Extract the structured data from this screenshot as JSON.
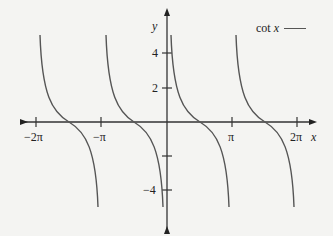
{
  "chart_data": {
    "type": "line",
    "title": "",
    "xlabel": "x",
    "ylabel": "y",
    "function": "cot x",
    "series": [
      {
        "name": "cot x",
        "color": "#555555",
        "branches": [
          {
            "domain": [
              "-2π",
              "-π"
            ],
            "points": [
              [
                -6.08,
                5
              ],
              [
                -5.5,
                1.41
              ],
              [
                -4.712,
                0
              ],
              [
                -3.93,
                -1.0
              ],
              [
                -3.34,
                -5
              ]
            ]
          },
          {
            "domain": [
              "-π",
              "0"
            ],
            "points": [
              [
                -2.94,
                5
              ],
              [
                -2.36,
                1.0
              ],
              [
                -1.571,
                0
              ],
              [
                -0.785,
                -1.0
              ],
              [
                -0.2,
                -5
              ]
            ]
          },
          {
            "domain": [
              "0",
              "π"
            ],
            "points": [
              [
                0.2,
                5
              ],
              [
                0.785,
                1.0
              ],
              [
                1.571,
                0
              ],
              [
                2.36,
                -1.0
              ],
              [
                2.94,
                -5
              ]
            ]
          },
          {
            "domain": [
              "π",
              "2π"
            ],
            "points": [
              [
                3.34,
                5
              ],
              [
                3.93,
                1.0
              ],
              [
                4.712,
                0
              ],
              [
                5.5,
                -1.41
              ],
              [
                6.08,
                -5
              ]
            ]
          }
        ]
      }
    ],
    "x_ticks": [
      "-2π",
      "-π",
      "π",
      "2π"
    ],
    "x_tick_values": [
      -6.2832,
      -3.1416,
      3.1416,
      6.2832
    ],
    "y_ticks": [
      4,
      2,
      -2,
      -4
    ],
    "y_tick_labels": [
      "4",
      "2",
      "",
      "-4"
    ],
    "xlim": [
      -7.0,
      7.5
    ],
    "ylim": [
      -5.5,
      5.5
    ],
    "grid": false,
    "legend": {
      "position": "top-right",
      "entries": [
        "cot x"
      ]
    }
  },
  "labels": {
    "x_axis": "x",
    "y_axis": "y",
    "legend": "cot x",
    "tick_neg_2pi": "−2π",
    "tick_neg_pi": "−π",
    "tick_pi": "π",
    "tick_2pi": "2π",
    "tick_y4": "4",
    "tick_y2": "2",
    "tick_yneg4": "−4"
  }
}
